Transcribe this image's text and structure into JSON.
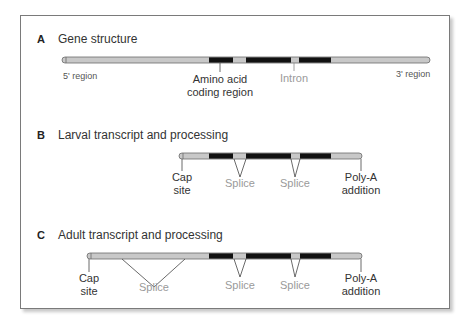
{
  "panels": [
    {
      "letter": "A",
      "title": "Gene structure",
      "labels": {
        "left": "5' region",
        "right": "3' region",
        "coding_line1": "Amino acid",
        "coding_line2": "coding region",
        "intron": "Intron"
      }
    },
    {
      "letter": "B",
      "title": "Larval transcript and processing",
      "labels": {
        "cap_line1": "Cap",
        "cap_line2": "site",
        "splice1": "Splice",
        "splice2": "Splice",
        "polya_line1": "Poly-A",
        "polya_line2": "addition"
      }
    },
    {
      "letter": "C",
      "title": "Adult transcript and processing",
      "labels": {
        "cap_line1": "Cap",
        "cap_line2": "site",
        "splice0": "Splice",
        "splice1": "Splice",
        "splice2": "Splice",
        "polya_line1": "Poly-A",
        "polya_line2": "addition"
      }
    }
  ],
  "colors": {
    "exon_coding": "#111111",
    "noncoding": "#c8c8c8",
    "outline": "#6a6a6a",
    "splice_label": "#9a9a9a"
  }
}
